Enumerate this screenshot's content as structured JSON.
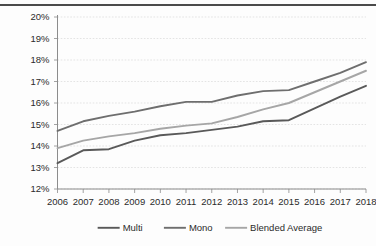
{
  "chart_data": {
    "type": "line",
    "title": "",
    "xlabel": "",
    "ylabel": "",
    "grid": true,
    "legend_position": "bottom",
    "categories": [
      "2006",
      "2007",
      "2008",
      "2009",
      "2010",
      "2011",
      "2012",
      "2013",
      "2014",
      "2015",
      "2016",
      "2017",
      "2018"
    ],
    "x": [
      2006,
      2007,
      2008,
      2009,
      2010,
      2011,
      2012,
      2013,
      2014,
      2015,
      2016,
      2017,
      2018
    ],
    "ylim": [
      12,
      20
    ],
    "ytick_labels": [
      "20%",
      "19%",
      "18%",
      "17%",
      "16%",
      "15%",
      "14%",
      "13%",
      "12%"
    ],
    "ytick_values": [
      20,
      19,
      18,
      17,
      16,
      15,
      14,
      13,
      12
    ],
    "xlim": [
      2006,
      2018
    ],
    "series": [
      {
        "name": "Multi",
        "color": "#595959",
        "values": [
          13.2,
          13.8,
          13.85,
          14.25,
          14.5,
          14.6,
          14.75,
          14.9,
          15.15,
          15.2,
          15.75,
          16.3,
          16.8
        ]
      },
      {
        "name": "Mono",
        "color": "#6e6e6e",
        "values": [
          14.7,
          15.15,
          15.4,
          15.6,
          15.85,
          16.05,
          16.05,
          16.35,
          16.55,
          16.6,
          17.0,
          17.4,
          17.9
        ]
      },
      {
        "name": "Blended Average",
        "color": "#a6a6a6",
        "values": [
          13.9,
          14.25,
          14.45,
          14.6,
          14.8,
          14.95,
          15.05,
          15.35,
          15.7,
          16.0,
          16.5,
          17.0,
          17.5
        ]
      }
    ]
  },
  "legend": {
    "items": [
      {
        "label": "Multi",
        "color": "#595959"
      },
      {
        "label": "Mono",
        "color": "#6e6e6e"
      },
      {
        "label": "Blended Average",
        "color": "#a6a6a6"
      }
    ]
  }
}
